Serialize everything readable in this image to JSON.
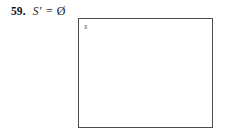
{
  "page": {
    "background_color": "#ffffff",
    "text_color": "#1b1b1b"
  },
  "exercise": {
    "number": "59.",
    "expression": {
      "full_text": "S' = Ø",
      "set_symbol": "S",
      "prime": "′",
      "equals": "=",
      "result": "Ø",
      "result_name": "empty-set"
    }
  },
  "diagram": {
    "type": "venn-diagram",
    "frame_label": "S",
    "frame_label_meaning": "universal-set",
    "border_color": "#4b4b50",
    "fill_color": "#ffffff",
    "shaded_regions": [],
    "circles": []
  }
}
